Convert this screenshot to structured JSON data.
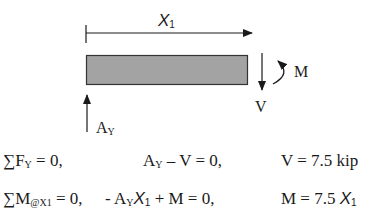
{
  "diagram": {
    "type": "free-body-diagram",
    "beam": {
      "fill": "#a3a3a3",
      "stroke": "#333333"
    },
    "dimension": {
      "label_main": "X",
      "label_sub": "1"
    },
    "forces": {
      "shear": {
        "label": "V",
        "direction": "down"
      },
      "moment": {
        "label": "M",
        "direction": "clockwise"
      },
      "reaction": {
        "label_main": "A",
        "label_sub": "Y",
        "direction": "up"
      }
    }
  },
  "equations": [
    {
      "condition": {
        "sigma": "∑",
        "main": "F",
        "sub": "Y",
        "rest": " = 0,"
      },
      "expression": {
        "a": "A",
        "a_sub": "Y",
        "rest": " – V = 0,"
      },
      "result": {
        "text": "V = 7.5 kip"
      }
    },
    {
      "condition": {
        "sigma": "∑",
        "main": "M",
        "sub": "@X1",
        "rest": " = 0,"
      },
      "expression": {
        "prefix": "- A",
        "a_sub": "Y",
        "x": "X",
        "x_sub": "1",
        "rest": " + M = 0,"
      },
      "result": {
        "prefix": "M = 7.5 ",
        "x": "X",
        "x_sub": "1"
      }
    }
  ]
}
